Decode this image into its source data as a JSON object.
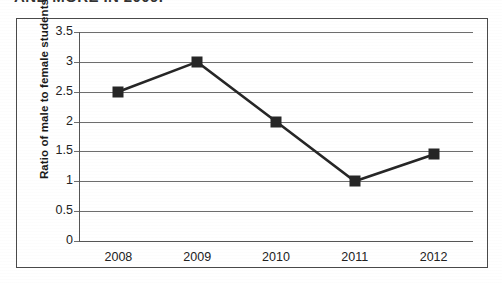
{
  "cut_title": "AND MORE IN 2009.",
  "axis": {
    "y_title": "Ratio of male to female students",
    "y_ticks": [
      "3.5",
      "3",
      "2.5",
      "2",
      "1.5",
      "1",
      "0.5",
      "0"
    ],
    "x_ticks": [
      "2008",
      "2009",
      "2010",
      "2011",
      "2012"
    ]
  },
  "chart_data": {
    "type": "line",
    "title": "",
    "xlabel": "",
    "ylabel": "Ratio of male to female students",
    "categories": [
      "2008",
      "2009",
      "2010",
      "2011",
      "2012"
    ],
    "values": [
      2.5,
      3.0,
      2.0,
      1.0,
      1.45
    ],
    "ylim": [
      0,
      3.5
    ],
    "ytick_values": [
      0,
      0.5,
      1,
      1.5,
      2,
      2.5,
      3,
      3.5
    ],
    "grid": "horizontal",
    "legend": "none",
    "marker": "square",
    "series": [
      {
        "name": "Ratio of male to female students",
        "values": [
          2.5,
          3.0,
          2.0,
          1.0,
          1.45
        ]
      }
    ],
    "colors": {
      "line": "#262626",
      "marker": "#262626",
      "gridline": "#6d6d6d",
      "axis": "#555555",
      "frame": "#4a4a4a",
      "background": "#ffffff"
    }
  }
}
